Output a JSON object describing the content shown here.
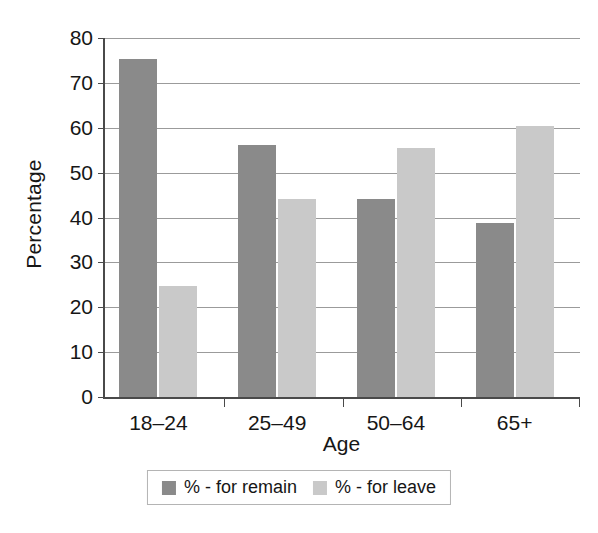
{
  "chart_data": {
    "type": "bar",
    "title": "",
    "subtitle": "",
    "xlabel": "Age",
    "ylabel": "Percentage",
    "categories": [
      "18–24",
      "25–49",
      "50–64",
      "65+"
    ],
    "series": [
      {
        "name": "% - for remain",
        "color": "#8a8a8a",
        "values": [
          75.3,
          56.2,
          44.1,
          38.7
        ]
      },
      {
        "name": "% - for leave",
        "color": "#c9c9c9",
        "values": [
          24.8,
          44.2,
          55.4,
          60.3
        ]
      }
    ],
    "ylim": [
      0,
      80
    ],
    "yticks": [
      0,
      10,
      20,
      30,
      40,
      50,
      60,
      70,
      80
    ],
    "ytick_labels": [
      "0",
      "10",
      "20",
      "30",
      "40",
      "50",
      "60",
      "70",
      "80"
    ],
    "grid": true,
    "grid_axis": "y",
    "legend_position": "bottom",
    "background_color": "#ffffff",
    "axis_color": "#4a4a4a",
    "gridline_color": "#9b9b9b"
  },
  "axes": {
    "y_title": "Percentage",
    "x_title": "Age"
  },
  "legend": {
    "items": [
      {
        "label": "% - for remain",
        "color": "#8a8a8a"
      },
      {
        "label": "% - for leave",
        "color": "#c9c9c9"
      }
    ]
  }
}
